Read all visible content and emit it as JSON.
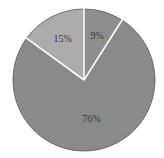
{
  "chart_data": {
    "type": "pie",
    "title": "",
    "categories": [
      "Slice A",
      "Slice B",
      "Slice C"
    ],
    "values": [
      9,
      76,
      15
    ],
    "labels": [
      "9%",
      "76%",
      "15%"
    ],
    "colors": [
      "#8e8e8e",
      "#8a8a8a",
      "#ababab"
    ],
    "start_angle_deg": 0,
    "direction": "clockwise",
    "legend": "none"
  },
  "layout": {
    "cx": 84,
    "cy": 80,
    "r": 71,
    "gap_color": "#ffffff",
    "edge_color": "#555555"
  }
}
